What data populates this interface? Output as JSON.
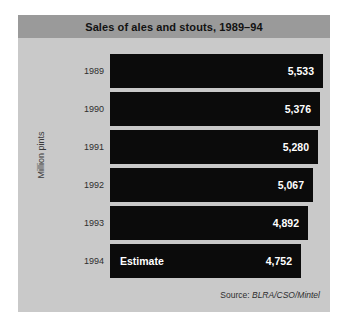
{
  "chart_data": {
    "type": "bar",
    "orientation": "horizontal",
    "title": "Sales of ales and stouts, 1989–94",
    "xlabel": "",
    "ylabel": "Million pints",
    "categories": [
      "1989",
      "1990",
      "1991",
      "1992",
      "1993",
      "1994"
    ],
    "values": [
      5533,
      5376,
      5280,
      5067,
      4892,
      4752
    ],
    "value_labels": [
      "5,533",
      "5,376",
      "5,280",
      "5,067",
      "4,892",
      "4,752"
    ],
    "annotations": [
      {
        "category": "1994",
        "text": "Estimate"
      }
    ],
    "grid": false,
    "legend": false,
    "xlim": [
      0,
      5533
    ],
    "bar_color": "#0b0b0b",
    "panel_color": "#c9c9c9",
    "title_band_color": "#9a9a9a",
    "value_label_color": "#ffffff"
  },
  "panel": {
    "title": "Sales of ales and stouts, 1989–94",
    "axis_title": "Million pints"
  },
  "bars": [
    {
      "year": "1989",
      "value": "5,533",
      "note": "",
      "length_pct": 100.0
    },
    {
      "year": "1990",
      "value": "5,376",
      "note": "",
      "length_pct": 98.5
    },
    {
      "year": "1991",
      "value": "5,280",
      "note": "",
      "length_pct": 97.5
    },
    {
      "year": "1992",
      "value": "5,067",
      "note": "",
      "length_pct": 95.4
    },
    {
      "year": "1993",
      "value": "4,892",
      "note": "",
      "length_pct": 93.0
    },
    {
      "year": "1994",
      "value": "4,752",
      "note": "Estimate",
      "length_pct": 89.8
    }
  ],
  "source": {
    "prefix": "Source: ",
    "attribution": "BLRA/CSO/Mintel"
  }
}
